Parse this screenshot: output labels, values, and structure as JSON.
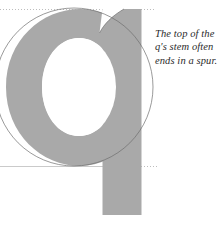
{
  "figure": {
    "type": "typography-anatomy-diagram",
    "letter": "q",
    "letter_case": "lowercase",
    "background_color": "#ffffff",
    "glyph_fill_color": "#a9a9a9",
    "counter_color": "#ffffff",
    "outline_color": "#6e6e6e",
    "guide_color": "#b9b9b9",
    "text_color": "#2b2b2b"
  },
  "annotation": {
    "lines": [
      "The top of the",
      "q's stem often",
      "ends in a spur."
    ],
    "full_text": "The top of the q's stem often ends in a spur.",
    "style": "italic"
  },
  "guides": {
    "xheight_line": {
      "name": "x-height",
      "style": "dotted",
      "y": 9
    },
    "baseline": {
      "name": "baseline",
      "style": "solid-left-dotted-right",
      "y": 166
    },
    "construction_circle": {
      "name": "bowl-construction-circle",
      "style": "thin-outline",
      "cx": 74,
      "cy": 87,
      "r": 79
    }
  },
  "parts": {
    "bowl": "bowl",
    "counter": "counter",
    "stem": "stem",
    "descender": "descender",
    "spur": "spur"
  }
}
